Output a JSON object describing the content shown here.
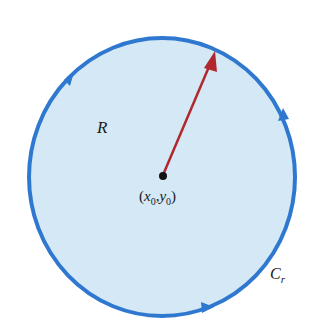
{
  "diagram": {
    "type": "region-with-boundary-curve",
    "region_label": "R",
    "curve_label": "C",
    "curve_label_subscript": "r",
    "center_label_open": "(",
    "center_label_x": "x",
    "center_label_x_sub": "0",
    "center_label_comma": ",",
    "center_label_y": "y",
    "center_label_y_sub": "0",
    "center_label_close": ")",
    "orientation": "counterclockwise",
    "colors": {
      "region_fill": "#d4e8f5",
      "boundary": "#2f78d0",
      "radius_arrow": "#b0282e",
      "center_point": "#111111",
      "text": "#1a1a1a"
    }
  }
}
